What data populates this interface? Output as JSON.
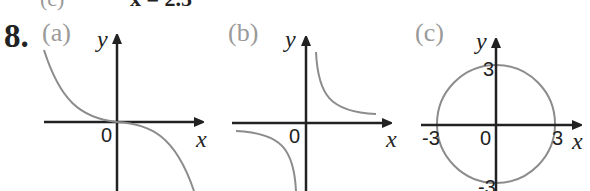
{
  "previous_line": {
    "label": "(c)",
    "text": "x = 2.5"
  },
  "question": {
    "number": "8."
  },
  "panels": [
    {
      "label": "(a)",
      "x_label": "x",
      "y_label": "y",
      "origin_label": "0",
      "curve": "decreasing cubic through origin"
    },
    {
      "label": "(b)",
      "x_label": "x",
      "y_label": "y",
      "origin_label": "0",
      "curve": "hyperbola y = k/x (quadrants I and III)"
    },
    {
      "label": "(c)",
      "x_label": "x",
      "y_label": "y",
      "origin_label": "0",
      "curve": "circle radius 3",
      "ticks": {
        "x_neg": "-3",
        "x_pos": "3",
        "y_pos": "3",
        "y_neg": "-3"
      }
    }
  ],
  "colors": {
    "axis": "#222222",
    "curve": "#8c8c8c",
    "label_gray": "#9a9a9a"
  }
}
